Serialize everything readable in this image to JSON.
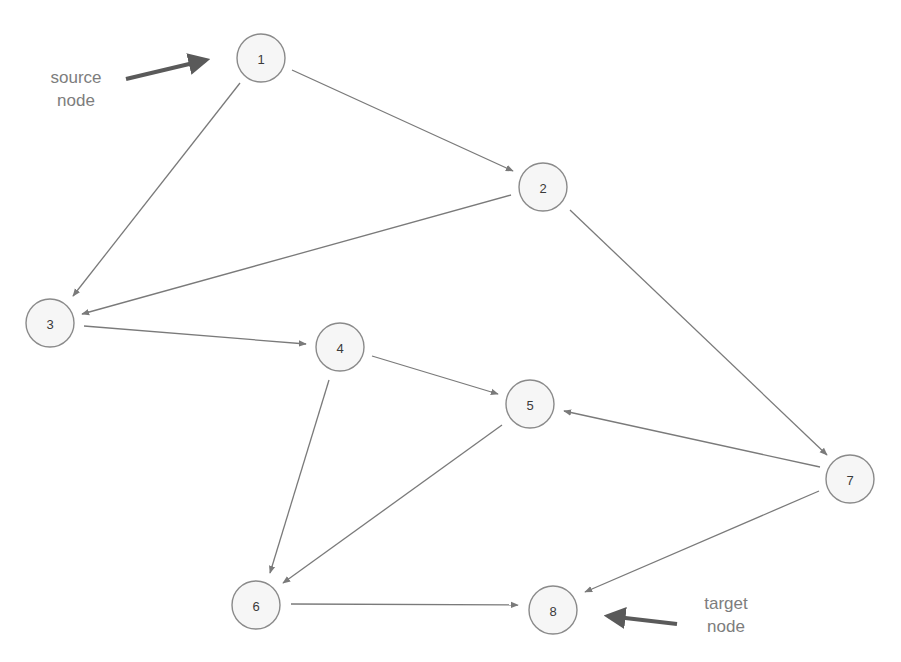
{
  "diagram": {
    "type": "directed-graph",
    "nodes": [
      {
        "id": "1",
        "label": "1",
        "x": 261,
        "y": 58
      },
      {
        "id": "2",
        "label": "2",
        "x": 543,
        "y": 187
      },
      {
        "id": "3",
        "label": "3",
        "x": 50,
        "y": 323
      },
      {
        "id": "4",
        "label": "4",
        "x": 340,
        "y": 347
      },
      {
        "id": "5",
        "label": "5",
        "x": 530,
        "y": 404
      },
      {
        "id": "6",
        "label": "6",
        "x": 256,
        "y": 605
      },
      {
        "id": "7",
        "label": "7",
        "x": 850,
        "y": 479
      },
      {
        "id": "8",
        "label": "8",
        "x": 553,
        "y": 610
      }
    ],
    "edges": [
      {
        "from": "1",
        "to": "2",
        "x1": 292,
        "y1": 70,
        "x2": 513,
        "y2": 171
      },
      {
        "from": "1",
        "to": "3",
        "x1": 240,
        "y1": 83,
        "x2": 73,
        "y2": 296
      },
      {
        "from": "2",
        "to": "3",
        "x1": 511,
        "y1": 195,
        "x2": 82,
        "y2": 314
      },
      {
        "from": "2",
        "to": "7",
        "x1": 570,
        "y1": 210,
        "x2": 827,
        "y2": 455
      },
      {
        "from": "3",
        "to": "4",
        "x1": 84,
        "y1": 326,
        "x2": 306,
        "y2": 344
      },
      {
        "from": "4",
        "to": "5",
        "x1": 372,
        "y1": 356,
        "x2": 498,
        "y2": 394
      },
      {
        "from": "4",
        "to": "6",
        "x1": 329,
        "y1": 380,
        "x2": 270,
        "y2": 573
      },
      {
        "from": "5",
        "to": "6",
        "x1": 502,
        "y1": 425,
        "x2": 283,
        "y2": 583
      },
      {
        "from": "7",
        "to": "5",
        "x1": 820,
        "y1": 467,
        "x2": 564,
        "y2": 411
      },
      {
        "from": "7",
        "to": "8",
        "x1": 819,
        "y1": 491,
        "x2": 585,
        "y2": 592
      },
      {
        "from": "6",
        "to": "8",
        "x1": 291,
        "y1": 604,
        "x2": 518,
        "y2": 605
      }
    ],
    "node_radius": 24,
    "colors": {
      "node_fill": "#f6f6f6",
      "node_stroke": "#8a8a8a",
      "edge": "#7a7a7a",
      "pointer": "#5a5a5a",
      "annotation_text": "#7d7d7d"
    }
  },
  "annotations": {
    "source": {
      "line1": "source",
      "line2": "node",
      "points_to": "1"
    },
    "target": {
      "line1": "target",
      "line2": "node",
      "points_to": "8"
    }
  }
}
